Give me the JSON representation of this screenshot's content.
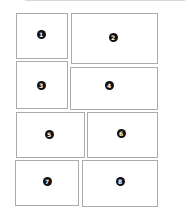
{
  "diagram": {
    "type": "comic-panel-layout",
    "border_color": "#ababab",
    "badge_color": "#111111",
    "badge_text_color": "#ffffff",
    "panels": [
      {
        "label": "1",
        "left": 16,
        "top": 13,
        "width": 52,
        "height": 46,
        "badge_x": 41,
        "badge_y": 34
      },
      {
        "label": "2",
        "left": 71,
        "top": 13,
        "width": 87,
        "height": 51,
        "badge_x": 113,
        "badge_y": 37
      },
      {
        "label": "3",
        "left": 16,
        "top": 61,
        "width": 52,
        "height": 48,
        "badge_x": 41,
        "badge_y": 85
      },
      {
        "label": "4",
        "left": 70,
        "top": 67,
        "width": 88,
        "height": 43,
        "badge_x": 109,
        "badge_y": 85
      },
      {
        "label": "5",
        "left": 16,
        "top": 112,
        "width": 69,
        "height": 46,
        "badge_x": 49,
        "badge_y": 134
      },
      {
        "label": "6",
        "left": 87,
        "top": 112,
        "width": 71,
        "height": 46,
        "badge_x": 121,
        "badge_y": 133
      },
      {
        "label": "7",
        "left": 15,
        "top": 160,
        "width": 64,
        "height": 46,
        "badge_x": 47,
        "badge_y": 181
      },
      {
        "label": "8",
        "left": 82,
        "top": 160,
        "width": 76,
        "height": 47,
        "badge_x": 120,
        "badge_y": 181
      }
    ]
  }
}
